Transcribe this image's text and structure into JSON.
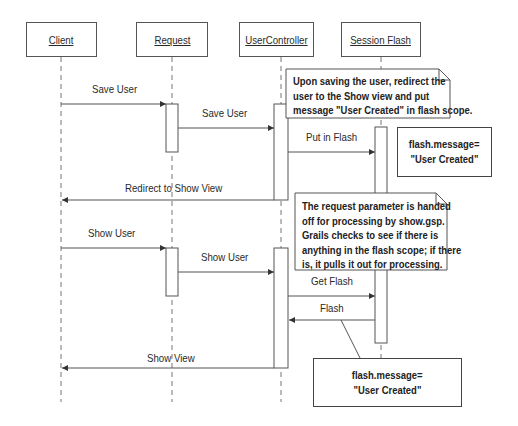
{
  "actors": [
    {
      "name": "Client"
    },
    {
      "name": "Request"
    },
    {
      "name": "UserController"
    },
    {
      "name": "Session Flash"
    }
  ],
  "messages": [
    {
      "label": "Save User",
      "from": "Client",
      "to": "Request"
    },
    {
      "label": "Save User",
      "from": "Request",
      "to": "UserController"
    },
    {
      "label": "Put in Flash",
      "from": "UserController",
      "to": "Session Flash"
    },
    {
      "label": "Redirect to Show View",
      "from": "UserController",
      "to": "Client"
    },
    {
      "label": "Show User",
      "from": "Client",
      "to": "Request"
    },
    {
      "label": "Show User",
      "from": "Request",
      "to": "UserController"
    },
    {
      "label": "Get Flash",
      "from": "UserController",
      "to": "Session Flash"
    },
    {
      "label": "Flash",
      "from": "Session Flash",
      "to": "UserController"
    },
    {
      "label": "Show View",
      "from": "UserController",
      "to": "Client"
    }
  ],
  "notes": [
    {
      "lines": [
        "Upon saving the user, redirect the",
        "user to the Show view and put",
        "message \"User Created\" in flash scope."
      ]
    },
    {
      "lines": [
        "The request parameter is handed",
        "off for processing by show.gsp.",
        "Grails checks to see if there is",
        "anything in the flash scope; if there",
        "is, it pulls it out for processing."
      ]
    }
  ],
  "flash_boxes": [
    {
      "line1": "flash.message=",
      "line2": "\"User Created\""
    },
    {
      "line1": "flash.message=",
      "line2": "\"User Created\""
    }
  ],
  "colors": {
    "line": "#555555",
    "lifeline": "#777777",
    "text": "#222222"
  }
}
